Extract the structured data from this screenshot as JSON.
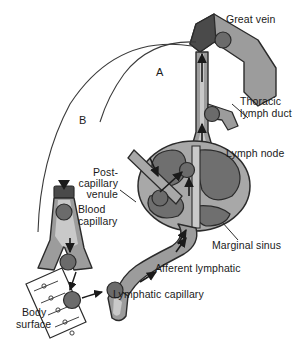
{
  "figure": {
    "background_color": "#ffffff",
    "palette": {
      "vessel_wall": "#9c9c9c",
      "vessel_lumen": "#c9c9c9",
      "node_cortex": "#6f6f6f",
      "node_sinus": "#a8a8a8",
      "cell_dark": "#6b6b6b",
      "outline": "#2b2b2b",
      "vein_cap": "#4a4a4a",
      "text": "#1a1a1a"
    }
  },
  "labels": {
    "great_vein": "Great vein",
    "thoracic_lymph_duct": "Thoracic\nlymph duct",
    "thoracic_lymph_duct_line1": "Thoracic",
    "thoracic_lymph_duct_line2": "lymph duct",
    "lymph_node": "Lymph node",
    "marginal_sinus": "Marginal sinus",
    "afferent_lymphatic": "Afferent lymphatic",
    "lymphatic_capillary": "Lymphatic capillary",
    "post_capillary_venule_line1": "Post-",
    "post_capillary_venule_line2": "capillary",
    "post_capillary_venule_line3": "venule",
    "blood_capillary_line1": "Blood",
    "blood_capillary_line2": "capillary",
    "body_surface_line1": "Body",
    "body_surface_line2": "surface"
  },
  "route_markers": {
    "a": "A",
    "b": "B"
  }
}
